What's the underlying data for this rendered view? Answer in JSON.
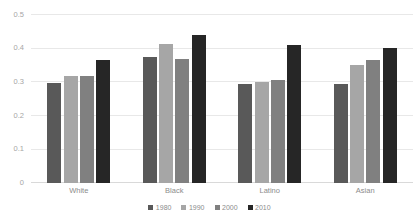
{
  "chart_data": {
    "type": "bar",
    "title": "",
    "subtitle": "",
    "xlabel": "",
    "ylabel": "",
    "ylim": [
      0,
      0.5
    ],
    "ytick_labels": [
      "0.5",
      "0.4",
      "0.3",
      "0.2",
      "0.1",
      "0"
    ],
    "ytick_values": [
      0.5,
      0.4,
      0.3,
      0.2,
      0.1,
      0
    ],
    "grid": true,
    "legend_position": "bottom",
    "categories": [
      "White",
      "Black",
      "Latino",
      "Asian"
    ],
    "series": [
      {
        "name": "1980",
        "color": "#595959",
        "values": [
          0.295,
          0.375,
          0.293,
          0.293
        ]
      },
      {
        "name": "1990",
        "color": "#a6a6a6",
        "values": [
          0.318,
          0.413,
          0.3,
          0.35
        ]
      },
      {
        "name": "2000",
        "color": "#808080",
        "values": [
          0.318,
          0.367,
          0.305,
          0.365
        ]
      },
      {
        "name": "2010",
        "color": "#262626",
        "values": [
          0.365,
          0.438,
          0.41,
          0.4
        ]
      }
    ]
  },
  "colors": {
    "gridline": "#e8e8e8",
    "baseline": "#d9d9d9",
    "tick_text": "#a6a6a6",
    "category_text": "#8c8c8c",
    "legend_text": "#8c8c8c",
    "background": "#ffffff"
  }
}
